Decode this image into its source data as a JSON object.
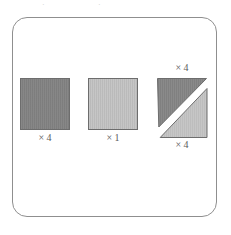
{
  "figure": {
    "panel": {
      "border_color": "#8f8f8f",
      "background": "#ffffff",
      "corner_radius": "15px"
    },
    "colors": {
      "dark_fill": "#808080",
      "light_fill": "#bdbdbd",
      "shape_outline": "#6d6d6d",
      "label_text": "#5c5c5c",
      "gap": "#ffffff"
    },
    "top_artifacts": [
      {
        "text": "·",
        "left": 42,
        "top": 1
      },
      {
        "text": "·",
        "left": 98,
        "top": 1
      }
    ],
    "shapes": [
      {
        "name": "dark-square",
        "kind": "square",
        "fill": "dark",
        "labels": [
          {
            "position": "below",
            "text": "× 4"
          }
        ]
      },
      {
        "name": "light-square",
        "kind": "square",
        "fill": "light",
        "labels": [
          {
            "position": "below",
            "text": "× 1"
          }
        ]
      },
      {
        "name": "split-square",
        "kind": "diagonal-split-square",
        "fill_upper_left": "dark",
        "fill_lower_right": "light",
        "labels": [
          {
            "position": "above",
            "text": "× 4"
          },
          {
            "position": "below",
            "text": "× 4"
          }
        ]
      }
    ]
  }
}
